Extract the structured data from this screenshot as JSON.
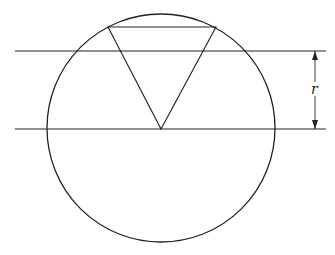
{
  "diagram": {
    "stroke_color": "#222222",
    "background": "#ffffff",
    "circle": {
      "cx": 161,
      "cy": 128,
      "r": 114
    },
    "lines": [
      {
        "name": "upper-horizontal-line",
        "x1": 15,
        "y1": 51,
        "x2": 326,
        "y2": 51
      },
      {
        "name": "lower-horizontal-line",
        "x1": 15,
        "y1": 129,
        "x2": 326,
        "y2": 129
      }
    ],
    "triangle": {
      "points": [
        [
          108,
          27
        ],
        [
          216,
          27
        ],
        [
          161,
          129
        ]
      ]
    },
    "dimension": {
      "x": 315,
      "y_top": 51,
      "y_bottom": 129,
      "label": "r"
    }
  }
}
